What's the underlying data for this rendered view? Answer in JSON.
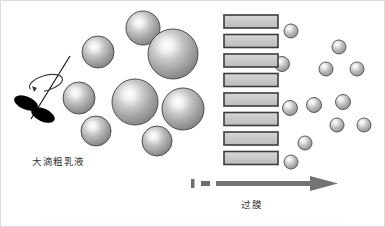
{
  "figure": {
    "title": "",
    "background_color": "#ffffff",
    "width": 385,
    "height": 227,
    "labels": {
      "coarse_emulsion": "大滴粗乳液",
      "membrane_process": "过膜"
    },
    "colors": {
      "droplet_edge": "#5a5a5a",
      "droplet_mid": "#9a9a9a",
      "droplet_highlight": "#ffffff",
      "membrane_fill": "#c9c9c9",
      "membrane_border": "#3c3c3c",
      "arrow": "#737373",
      "stirrer": "#000000",
      "text": "#333333"
    },
    "stirrer": {
      "name": "stirrer-impeller",
      "shaft": {
        "x1": 68,
        "y1": 56,
        "x2": 31,
        "y2": 117
      },
      "rotation_ellipse": {
        "cx": 44,
        "cy": 82,
        "rx": 17,
        "ry": 7,
        "rotation": -18
      },
      "blades": [
        {
          "cx": 25,
          "cy": 103,
          "rx": 12,
          "ry": 6.5,
          "rotation": 20
        },
        {
          "cx": 41,
          "cy": 115,
          "rx": 12,
          "ry": 6.5,
          "rotation": 25
        }
      ]
    },
    "coarse_droplets": [
      {
        "cx": 142,
        "cy": 27,
        "r": 17
      },
      {
        "cx": 97,
        "cy": 51,
        "r": 16
      },
      {
        "cx": 172,
        "cy": 53,
        "r": 25
      },
      {
        "cx": 78,
        "cy": 97,
        "r": 16
      },
      {
        "cx": 134,
        "cy": 101,
        "r": 23
      },
      {
        "cx": 182,
        "cy": 108,
        "r": 21
      },
      {
        "cx": 95,
        "cy": 130,
        "r": 15
      },
      {
        "cx": 156,
        "cy": 140,
        "r": 15
      }
    ],
    "membrane": {
      "name": "membrane-layers",
      "layer_count": 8,
      "layer_width": 54,
      "layer_height": 13,
      "layer_x": 223,
      "layer_y_start": 14,
      "layer_y_step": 19.5
    },
    "fine_droplets": [
      {
        "cx": 290,
        "cy": 30,
        "r": 7
      },
      {
        "cx": 338,
        "cy": 46,
        "r": 7
      },
      {
        "cx": 325,
        "cy": 68,
        "r": 7
      },
      {
        "cx": 356,
        "cy": 68,
        "r": 7
      },
      {
        "cx": 286,
        "cy": 68,
        "r": 7
      },
      {
        "cx": 313,
        "cy": 104,
        "r": 7.5
      },
      {
        "cx": 342,
        "cy": 101,
        "r": 7.5
      },
      {
        "cx": 289,
        "cy": 107,
        "r": 7.5
      },
      {
        "cx": 336,
        "cy": 124,
        "r": 7
      },
      {
        "cx": 363,
        "cy": 124,
        "r": 7
      },
      {
        "cx": 304,
        "cy": 142,
        "r": 7
      },
      {
        "cx": 290,
        "cy": 161,
        "r": 7
      },
      {
        "cx": 281,
        "cy": 63,
        "r": 7
      }
    ],
    "flow_arrow": {
      "name": "flow-arrow",
      "dash_marks": [
        {
          "x": 190,
          "y": 178,
          "width": 3,
          "height": 9
        },
        {
          "x": 199,
          "y": 180,
          "width": 9,
          "height": 5
        }
      ],
      "shaft": {
        "x": 214,
        "y": 180,
        "width": 96,
        "height": 5
      },
      "head": {
        "points": "310,175 336,182.5 310,190"
      }
    }
  }
}
